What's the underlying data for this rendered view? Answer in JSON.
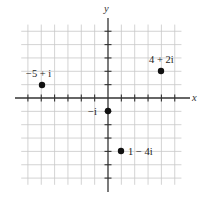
{
  "diagram": {
    "type": "complex-plane",
    "axes": {
      "x_label": "x",
      "y_label": "y",
      "x_range": [
        -6,
        5
      ],
      "y_range": [
        -6,
        5
      ],
      "grid": true
    },
    "points": [
      {
        "label": "−5 + i",
        "re": -5,
        "im": 1
      },
      {
        "label": "4 + 2i",
        "re": 4,
        "im": 2
      },
      {
        "label": "−i",
        "re": 0,
        "im": -1
      },
      {
        "label": "1 − 4i",
        "re": 1,
        "im": -4
      }
    ],
    "colors": {
      "grid": "#c8c8c8",
      "axis": "#333333",
      "point": "#111111"
    }
  }
}
